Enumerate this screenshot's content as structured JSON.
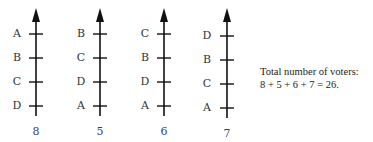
{
  "ballots": [
    {
      "ranking": [
        "A",
        "B",
        "C",
        "D"
      ],
      "count": "8"
    },
    {
      "ranking": [
        "B",
        "C",
        "D",
        "A"
      ],
      "count": "5"
    },
    {
      "ranking": [
        "C",
        "B",
        "D",
        "A"
      ],
      "count": "6"
    },
    {
      "ranking": [
        "D",
        "B",
        "C",
        "A"
      ],
      "count": "7"
    }
  ],
  "total": {
    "line1": "Total number of voters:",
    "line2": "8 + 5 + 6 + 7 = 26."
  },
  "colors": {
    "axis": "#111111",
    "count": "#2b3f8f"
  }
}
